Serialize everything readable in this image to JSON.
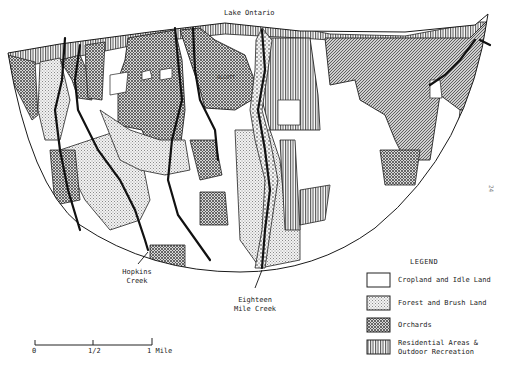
{
  "map": {
    "labels": {
      "lake": "Lake Ontario",
      "town": "OLCOTT",
      "creek_left_line1": "Hopkins",
      "creek_left_line2": "Creek",
      "creek_center_line1": "Eighteen",
      "creek_center_line2": "Mile Creek"
    }
  },
  "legend": {
    "title": "LEGEND",
    "items": [
      {
        "label": "Cropland and Idle Land",
        "pattern": "blank"
      },
      {
        "label": "Forest and Brush Land",
        "pattern": "fine-dots"
      },
      {
        "label": "Orchards",
        "pattern": "cross-hatch"
      },
      {
        "label_line1": "Residential Areas &",
        "label_line2": "Outdoor Recreation",
        "pattern": "vertical-lines"
      }
    ]
  },
  "scale_bar": {
    "ticks": [
      "0",
      "1/2",
      "1 Mile"
    ]
  },
  "page_number": "24",
  "colors": {
    "ink": "#1a1a1a",
    "paper": "#ffffff",
    "forest_fill": "#e4e4e4",
    "orchard_fill": "#9a9a9a"
  }
}
